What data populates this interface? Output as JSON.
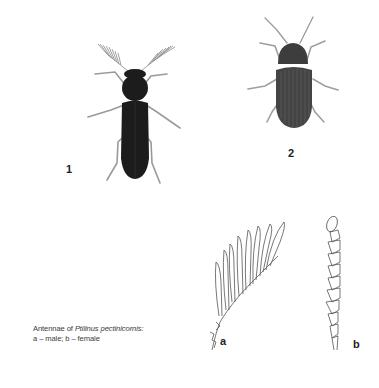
{
  "figures": [
    {
      "id": "1",
      "label": "1",
      "description": "Ptilinus beetle with pectinate (comb-like) antennae, dorsal view",
      "body_color": "#1c1c1c",
      "leg_color": "#9a9a9a"
    },
    {
      "id": "2",
      "label": "2",
      "description": "Beetle with filiform antennae and striated elytra, dorsal view",
      "body_color": "#3a3a3a",
      "leg_color": "#9a9a9a"
    }
  ],
  "antennae": [
    {
      "id": "a",
      "label": "a",
      "sex": "male",
      "form": "pectinate"
    },
    {
      "id": "b",
      "label": "b",
      "sex": "female",
      "form": "serrate"
    }
  ],
  "caption": {
    "prefix": "Antennae of ",
    "species": "Ptilinus pectinicornis:",
    "line2": "a – male; b – female"
  }
}
